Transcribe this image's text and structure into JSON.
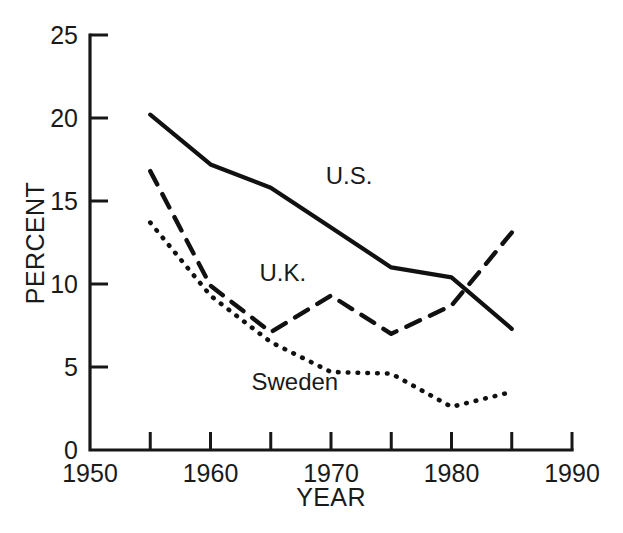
{
  "chart_data": {
    "type": "line",
    "title": "",
    "xlabel": "YEAR",
    "ylabel": "PERCENT",
    "xlim": [
      1950,
      1990
    ],
    "ylim": [
      0,
      25
    ],
    "xticks": [
      1950,
      1955,
      1960,
      1965,
      1970,
      1975,
      1980,
      1985,
      1990
    ],
    "xtick_labels": [
      "1950",
      "",
      "1960",
      "",
      "1970",
      "",
      "1980",
      "",
      "1990"
    ],
    "yticks": [
      0,
      5,
      10,
      15,
      20,
      25
    ],
    "ytick_labels": [
      "0",
      "5",
      "10",
      "15",
      "20",
      "25"
    ],
    "grid": false,
    "legend": "inline-annotations",
    "x": [
      1955,
      1960,
      1965,
      1970,
      1975,
      1980,
      1985
    ],
    "series": [
      {
        "name": "U.S.",
        "style": "solid",
        "label_x": 1971.5,
        "label_y": 16.0,
        "values": [
          20.2,
          17.2,
          15.8,
          13.4,
          11.0,
          10.4,
          7.3
        ]
      },
      {
        "name": "U.K.",
        "style": "dashed",
        "label_x": 1966.0,
        "label_y": 10.2,
        "values": [
          16.8,
          9.9,
          7.1,
          9.3,
          7.0,
          8.7,
          13.1
        ]
      },
      {
        "name": "Sweden",
        "style": "dotted",
        "label_x": 1967.0,
        "label_y": 3.6,
        "values": [
          13.7,
          9.3,
          6.5,
          4.7,
          4.6,
          2.6,
          3.5
        ]
      }
    ]
  },
  "axes": {
    "y_axis_title": "PERCENT",
    "x_axis_title": "YEAR"
  }
}
